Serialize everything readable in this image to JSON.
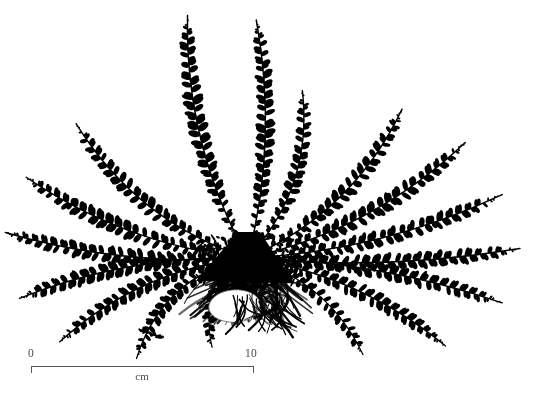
{
  "figure": {
    "kind": "botanical-specimen-illustration",
    "background_color": "#ffffff",
    "ink_color": "#000000",
    "width": 535,
    "height": 400
  },
  "scale_bar": {
    "start_label": "0",
    "end_label": "10",
    "unit_label": "cm",
    "start_x": 31,
    "end_x": 253,
    "baseline_y": 366,
    "tick_length": 6,
    "line_color": "#555555"
  },
  "specimen": {
    "center_x": 248,
    "center_y": 258,
    "rootstock_color": "#000000",
    "frond_count": 17,
    "fronds": [
      {
        "id": "frond-up-left",
        "angle_deg": -104,
        "length": 250,
        "curve": -34,
        "pinnae": 46,
        "pinna_len": 9.0,
        "thick": 1.5
      },
      {
        "id": "frond-up-center",
        "angle_deg": -88,
        "length": 238,
        "curve": 26,
        "pinnae": 44,
        "pinna_len": 8.6,
        "thick": 1.5
      },
      {
        "id": "frond-up-right",
        "angle_deg": -72,
        "length": 176,
        "curve": 40,
        "pinnae": 34,
        "pinna_len": 7.6,
        "thick": 1.4
      },
      {
        "id": "frond-upper-left-1",
        "angle_deg": -142,
        "length": 218,
        "curve": -40,
        "pinnae": 42,
        "pinna_len": 8.2,
        "thick": 1.4
      },
      {
        "id": "frond-upper-left-2",
        "angle_deg": -160,
        "length": 236,
        "curve": -30,
        "pinnae": 44,
        "pinna_len": 8.4,
        "thick": 1.4
      },
      {
        "id": "frond-left-1",
        "angle_deg": -174,
        "length": 244,
        "curve": -22,
        "pinnae": 45,
        "pinna_len": 8.0,
        "thick": 1.4
      },
      {
        "id": "frond-left-2",
        "angle_deg": 170,
        "length": 232,
        "curve": 24,
        "pinnae": 43,
        "pinna_len": 8.2,
        "thick": 1.4
      },
      {
        "id": "frond-lower-left-1",
        "angle_deg": 156,
        "length": 206,
        "curve": 34,
        "pinnae": 40,
        "pinna_len": 7.8,
        "thick": 1.3
      },
      {
        "id": "frond-lower-left-2",
        "angle_deg": 138,
        "length": 150,
        "curve": 44,
        "pinnae": 31,
        "pinna_len": 7.2,
        "thick": 1.3
      },
      {
        "id": "frond-down-left",
        "angle_deg": 112,
        "length": 96,
        "curve": 34,
        "pinnae": 22,
        "pinna_len": 6.4,
        "thick": 1.2
      },
      {
        "id": "frond-upper-right-1",
        "angle_deg": -44,
        "length": 214,
        "curve": 40,
        "pinnae": 41,
        "pinna_len": 8.2,
        "thick": 1.4
      },
      {
        "id": "frond-upper-right-2",
        "angle_deg": -28,
        "length": 246,
        "curve": 34,
        "pinnae": 45,
        "pinna_len": 8.6,
        "thick": 1.5
      },
      {
        "id": "frond-right-1",
        "angle_deg": -14,
        "length": 262,
        "curve": 26,
        "pinnae": 47,
        "pinna_len": 8.4,
        "thick": 1.5
      },
      {
        "id": "frond-right-2",
        "angle_deg": -2,
        "length": 272,
        "curve": 18,
        "pinnae": 48,
        "pinna_len": 8.2,
        "thick": 1.4
      },
      {
        "id": "frond-right-3",
        "angle_deg": 10,
        "length": 258,
        "curve": -20,
        "pinnae": 46,
        "pinna_len": 8.0,
        "thick": 1.4
      },
      {
        "id": "frond-lower-right-1",
        "angle_deg": 24,
        "length": 216,
        "curve": -30,
        "pinnae": 41,
        "pinna_len": 7.6,
        "thick": 1.3
      },
      {
        "id": "frond-lower-right-2",
        "angle_deg": 40,
        "length": 150,
        "curve": -34,
        "pinnae": 30,
        "pinna_len": 7.0,
        "thick": 1.2
      }
    ],
    "rootstock": {
      "crown_width": 92,
      "crown_height": 46,
      "root_mass_width": 150,
      "root_mass_height": 64,
      "root_strand_count": 150
    }
  }
}
